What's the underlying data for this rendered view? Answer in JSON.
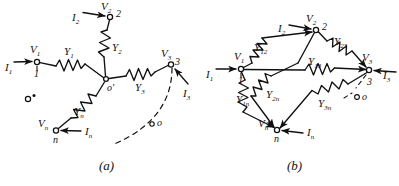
{
  "figure": {
    "type": "circuit-diagram",
    "stroke_color": "#111111",
    "background_color": "#ffffff",
    "panels": [
      {
        "id": "a",
        "caption": "(a)",
        "topology": "star / wye network with common node o-prime",
        "center_node": "o'",
        "reference_point": "o",
        "dashed_arc_label": "o",
        "terminals": [
          {
            "node": "1",
            "voltage": "V",
            "voltage_sub": "1",
            "current": "I",
            "current_sub": "1",
            "admittance": "Y",
            "admittance_sub": "1"
          },
          {
            "node": "2",
            "voltage": "V",
            "voltage_sub": "2",
            "current": "I",
            "current_sub": "2",
            "admittance": "Y",
            "admittance_sub": "2"
          },
          {
            "node": "3",
            "voltage": "V",
            "voltage_sub": "3",
            "current": "I",
            "current_sub": "3",
            "admittance": "Y",
            "admittance_sub": "3"
          },
          {
            "node": "n",
            "voltage": "V",
            "voltage_sub": "n",
            "current": "I",
            "current_sub": "n",
            "admittance": "Y",
            "admittance_sub": "n"
          }
        ]
      },
      {
        "id": "b",
        "caption": "(b)",
        "topology": "mesh / delta network with node n",
        "reference_point": "o",
        "terminals": [
          {
            "node": "1",
            "voltage": "V",
            "voltage_sub": "1",
            "current": "I",
            "current_sub": "1"
          },
          {
            "node": "2",
            "voltage": "V",
            "voltage_sub": "2",
            "current": "I",
            "current_sub": "2"
          },
          {
            "node": "3",
            "voltage": "V",
            "voltage_sub": "3",
            "current": "I",
            "current_sub": "3"
          },
          {
            "node": "n",
            "voltage": "V",
            "voltage_sub": "n",
            "current": "I",
            "current_sub": "n"
          }
        ],
        "branches": [
          {
            "admittance": "Y",
            "admittance_sub": "12",
            "between": "1-2"
          },
          {
            "admittance": "Y",
            "admittance_sub": "23",
            "between": "2-3"
          },
          {
            "admittance": "Y",
            "admittance_sub": "13",
            "between": "1-3"
          },
          {
            "admittance": "Y",
            "admittance_sub": "1n",
            "between": "1-n"
          },
          {
            "admittance": "Y",
            "admittance_sub": "2n",
            "between": "2-n"
          },
          {
            "admittance": "Y",
            "admittance_sub": "3n",
            "between": "3-n"
          }
        ]
      }
    ],
    "labels": {
      "a": {
        "I1": "I",
        "I1_sub": "1",
        "V1": "V",
        "V1_sub": "1",
        "node1": "1",
        "Y1": "Y",
        "Y1_sub": "1",
        "I2": "I",
        "I2_sub": "2",
        "V2": "V",
        "V2_sub": "2",
        "node2": "2",
        "Y2": "Y",
        "Y2_sub": "2",
        "I3": "I",
        "I3_sub": "3",
        "V3": "V",
        "V3_sub": "3",
        "node3": "3",
        "Y3": "Y",
        "Y3_sub": "3",
        "In": "I",
        "In_sub": "n",
        "Vn": "V",
        "Vn_sub": "n",
        "noden": "n",
        "Yn": "Y",
        "Yn_sub": "n",
        "oprime": "o'",
        "oref": "o",
        "oarc": "o",
        "caption": "(a)"
      },
      "b": {
        "I1": "I",
        "I1_sub": "1",
        "V1": "V",
        "V1_sub": "1",
        "node1": "1",
        "I2": "I",
        "I2_sub": "2",
        "V2": "V",
        "V2_sub": "2",
        "node2": "2",
        "I3": "I",
        "I3_sub": "3",
        "V3": "V",
        "V3_sub": "3",
        "node3": "3",
        "In": "I",
        "In_sub": "n",
        "Vn": "V",
        "Vn_sub": "n",
        "noden": "n",
        "Y12": "Y",
        "Y12_sub": "12",
        "Y23": "Y",
        "Y23_sub": "23",
        "Y13": "Y",
        "Y13_sub": "13",
        "Y1n": "Y",
        "Y1n_sub": "1n",
        "Y2n": "Y",
        "Y2n_sub": "2n",
        "Y3n": "Y",
        "Y3n_sub": "3n",
        "oref": "o",
        "caption": "(b)"
      }
    }
  }
}
